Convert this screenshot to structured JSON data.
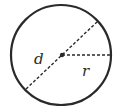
{
  "diagram": {
    "type": "circle-diameter-radius",
    "labels": {
      "diameter": "d",
      "radius": "r"
    },
    "colors": {
      "stroke": "#2a2a2a",
      "background": "#ffffff"
    }
  }
}
